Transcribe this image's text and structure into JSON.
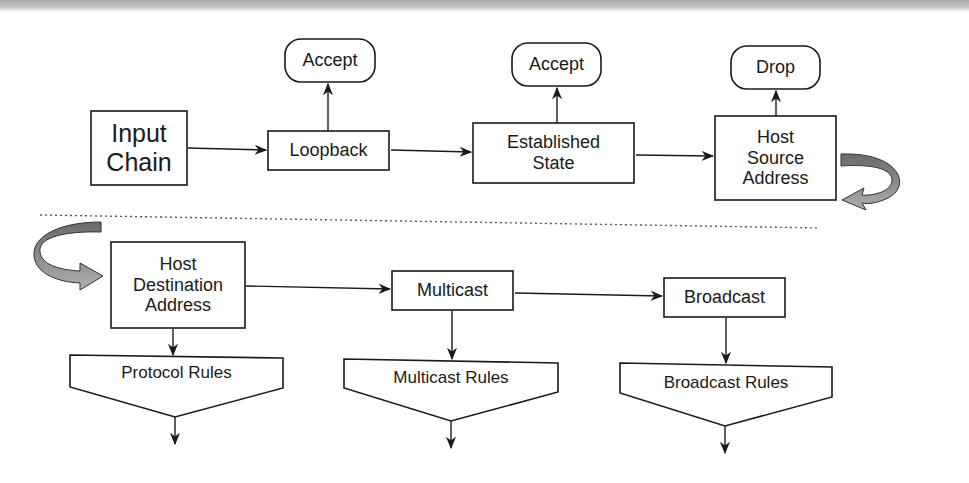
{
  "diagram": {
    "type": "flowchart",
    "title": "",
    "top_row": {
      "input_chain": "Input\nChain",
      "loopback": "Loopback",
      "established_state": "Established\nState",
      "host_source_address": "Host\nSource\nAddress",
      "accept_1": "Accept",
      "accept_2": "Accept",
      "drop": "Drop"
    },
    "bottom_row": {
      "host_destination_address": "Host\nDestination\nAddress",
      "multicast": "Multicast",
      "broadcast": "Broadcast",
      "protocol_rules": "Protocol Rules",
      "multicast_rules": "Multicast Rules",
      "broadcast_rules": "Broadcast Rules"
    },
    "edges": [
      {
        "from": "Input Chain",
        "to": "Loopback"
      },
      {
        "from": "Loopback",
        "to": "Accept"
      },
      {
        "from": "Loopback",
        "to": "Established State"
      },
      {
        "from": "Established State",
        "to": "Accept"
      },
      {
        "from": "Established State",
        "to": "Host Source Address"
      },
      {
        "from": "Host Source Address",
        "to": "Drop"
      },
      {
        "from": "Host Source Address",
        "to": "Host Destination Address",
        "style": "curved-continuation"
      },
      {
        "from": "Host Destination Address",
        "to": "Multicast"
      },
      {
        "from": "Host Destination Address",
        "to": "Protocol Rules"
      },
      {
        "from": "Multicast",
        "to": "Broadcast"
      },
      {
        "from": "Multicast",
        "to": "Multicast Rules"
      },
      {
        "from": "Broadcast",
        "to": "Broadcast Rules"
      }
    ],
    "colors": {
      "stroke": "#1a1a1a",
      "curved_arrow_dark": "#6e6e6e",
      "curved_arrow_light": "#a9a9a9",
      "divider": "#555555"
    }
  }
}
